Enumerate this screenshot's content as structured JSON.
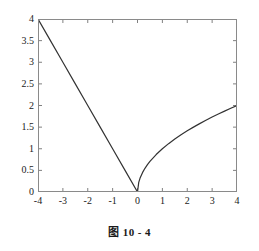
{
  "caption": "图 10 - 4",
  "chart_data": {
    "type": "line",
    "title": "",
    "subtitle": "",
    "xlabel": "",
    "ylabel": "",
    "xlim": [
      -4,
      4
    ],
    "ylim": [
      0,
      4
    ],
    "grid": false,
    "legend": null,
    "legend_position": "none",
    "xticks": [
      -4,
      -3,
      -2,
      -1,
      0,
      1,
      2,
      3,
      4
    ],
    "xticklabels": [
      "-4",
      "-3",
      "-2",
      "-1",
      "0",
      "1",
      "2",
      "3",
      "4"
    ],
    "yticks": [
      0,
      0.5,
      1,
      1.5,
      2,
      2.5,
      3,
      3.5,
      4
    ],
    "yticklabels": [
      "0",
      "0.5",
      "1",
      "1.5",
      "2",
      "2.5",
      "3",
      "3.5",
      "4"
    ],
    "line_color": "#333333",
    "axis_color": "#808080",
    "background": "#ffffff",
    "tick_direction": "in",
    "box": true,
    "series": [
      {
        "name": "left-branch",
        "description": "y = -x  for x in [-4, 0]",
        "x": [
          -4,
          -3.5,
          -3,
          -2.5,
          -2,
          -1.5,
          -1,
          -0.5,
          0
        ],
        "y": [
          4,
          3.5,
          3,
          2.5,
          2,
          1.5,
          1,
          0.5,
          0
        ]
      },
      {
        "name": "right-branch",
        "description": "y = sqrt(x)  for x in [0, 4]",
        "x": [
          0,
          0.05,
          0.1,
          0.2,
          0.3,
          0.4,
          0.5,
          0.75,
          1,
          1.25,
          1.5,
          1.75,
          2,
          2.25,
          2.5,
          2.75,
          3,
          3.25,
          3.5,
          3.75,
          4
        ],
        "y": [
          0,
          0.2236,
          0.3162,
          0.4472,
          0.5477,
          0.6325,
          0.7071,
          0.866,
          1,
          1.118,
          1.2247,
          1.3229,
          1.4142,
          1.5,
          1.5811,
          1.6583,
          1.7321,
          1.8028,
          1.8708,
          1.9365,
          2
        ]
      }
    ]
  }
}
